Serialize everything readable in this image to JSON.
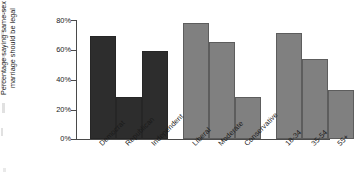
{
  "chart_data": {
    "type": "bar",
    "title": "",
    "subtitle": "",
    "xlabel": "",
    "ylabel": "Percentage saying same-sex marriage should be legal",
    "ylim": [
      0,
      80
    ],
    "yticks": [
      0,
      20,
      40,
      60,
      80
    ],
    "ytick_labels": [
      "0%",
      "20%",
      "40%",
      "60%",
      "80%"
    ],
    "grid": false,
    "legend": "none",
    "groups": [
      {
        "name": "Party",
        "color": "#2d2d2d",
        "categories": [
          "Democrat",
          "Republican",
          "Independent"
        ],
        "values": [
          69,
          28,
          59
        ]
      },
      {
        "name": "Ideology",
        "color": "#808080",
        "categories": [
          "Liberal",
          "Moderate",
          "Conservative"
        ],
        "values": [
          78,
          65,
          28
        ]
      },
      {
        "name": "Age",
        "color": "#808080",
        "categories": [
          "18-34",
          "35-54",
          "55+"
        ],
        "values": [
          71,
          54,
          33
        ]
      }
    ],
    "categories": [
      "Democrat",
      "Republican",
      "Independent",
      "Liberal",
      "Moderate",
      "Conservative",
      "18-34",
      "35-54",
      "55+"
    ],
    "values": [
      69,
      28,
      59,
      78,
      65,
      28,
      71,
      54,
      33
    ]
  },
  "axis": {
    "ticks": [
      {
        "label": "80%",
        "value": 80
      },
      {
        "label": "60%",
        "value": 60
      },
      {
        "label": "40%",
        "value": 40
      },
      {
        "label": "20%",
        "value": 20
      },
      {
        "label": "0%",
        "value": 0
      }
    ]
  },
  "bars": [
    {
      "label": "Democrat",
      "value": 69,
      "shade": "dark",
      "left": 13,
      "width": 26
    },
    {
      "label": "Republican",
      "value": 28,
      "shade": "dark",
      "left": 39,
      "width": 26
    },
    {
      "label": "Independent",
      "value": 59,
      "shade": "dark",
      "left": 65,
      "width": 26
    },
    {
      "label": "Liberal",
      "value": 78,
      "shade": "gray",
      "left": 106,
      "width": 26
    },
    {
      "label": "Moderate",
      "value": 65,
      "shade": "gray",
      "left": 132,
      "width": 26
    },
    {
      "label": "Conservative",
      "value": 28,
      "shade": "gray",
      "left": 158,
      "width": 26
    },
    {
      "label": "18-34",
      "value": 71,
      "shade": "gray",
      "left": 199,
      "width": 26
    },
    {
      "label": "35-54",
      "value": 54,
      "shade": "gray",
      "left": 225,
      "width": 26
    },
    {
      "label": "55+",
      "value": 33,
      "shade": "gray",
      "left": 251,
      "width": 26
    }
  ]
}
